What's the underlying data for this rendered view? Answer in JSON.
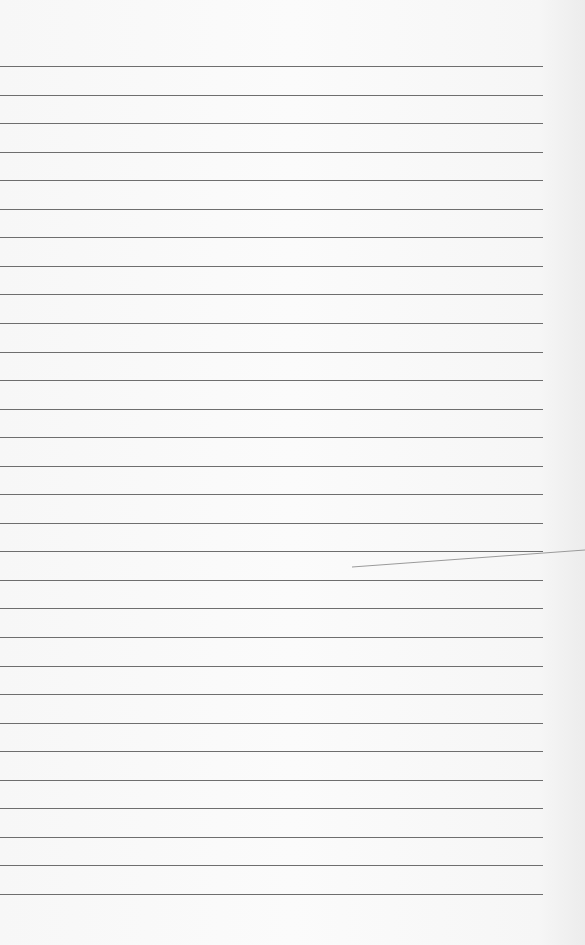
{
  "page": {
    "kind": "ruled-notebook-paper",
    "line_count": 30,
    "text_content": ""
  },
  "colors": {
    "paper": "#f7f7f7",
    "rule_line": "#6e6e6e",
    "stray_mark": "#9a9a9a"
  }
}
